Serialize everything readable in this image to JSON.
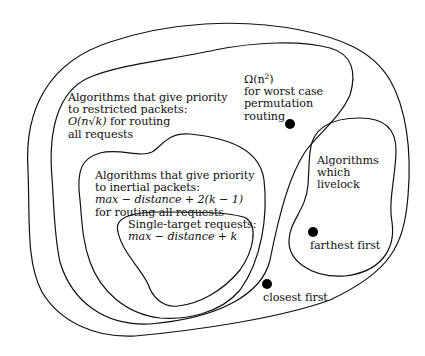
{
  "diagram": {
    "type": "nested-region-diagram",
    "colors": {
      "stroke": "#111111",
      "dot": "#000000",
      "background": "#ffffff"
    },
    "regions": [
      {
        "id": "all-algorithms",
        "label": ""
      },
      {
        "id": "restricted-priority",
        "label": "Algorithms that give priority to restricted packets: O(n√k) for routing all requests"
      },
      {
        "id": "inertial-priority",
        "label": "Algorithms that give priority to inertial packets: max − distance + 2(k − 1) for routing all requests"
      },
      {
        "id": "single-target",
        "label": "Single-target requests: max − distance + k"
      },
      {
        "id": "livelock",
        "label": "Algorithms which livelock"
      }
    ],
    "restricted": {
      "line1": "Algorithms that give priority",
      "line2": "to restricted packets:",
      "line3_math": "O(n√k)",
      "line3_text": " for routing",
      "line4": "all requests"
    },
    "lower_bound": {
      "line1_math": "Ω(n",
      "line1_sup": "2",
      "line1_close": ")",
      "line2": "for worst case",
      "line3": "permutation",
      "line4": "routing"
    },
    "inertial": {
      "line1": "Algorithms that give priority",
      "line2": "to inertial packets:",
      "line3_math": "max − distance + 2(k − 1)",
      "line4": "for routing all requests"
    },
    "single_target": {
      "line1": "Single-target requests:",
      "line2_math": "max − distance + k"
    },
    "livelock": {
      "line1": "Algorithms",
      "line2": "which",
      "line3": "livelock"
    },
    "points": [
      {
        "id": "permutation-routing",
        "label": "",
        "x": 290,
        "y": 124
      },
      {
        "id": "farthest-first",
        "label": "farthest first",
        "x": 313,
        "y": 232
      },
      {
        "id": "closest-first",
        "label": "closest first",
        "x": 267,
        "y": 284
      }
    ],
    "point_labels": {
      "farthest_first": "farthest first",
      "closest_first": "closest first"
    }
  }
}
